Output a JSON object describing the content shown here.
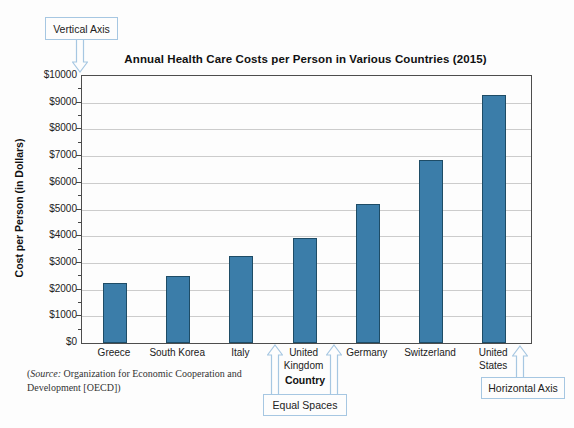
{
  "callouts": {
    "vertical_axis": "Vertical Axis",
    "horizontal_axis": "Horizontal Axis",
    "equal_spaces": "Equal Spaces"
  },
  "chart_data": {
    "type": "bar",
    "title": "Annual Health Care Costs per Person in Various Countries (2015)",
    "xlabel": "Country",
    "ylabel": "Cost per Person (in Dollars)",
    "categories": [
      "Greece",
      "South Korea",
      "Italy",
      "United Kingdom",
      "Germany",
      "Switzerland",
      "United States"
    ],
    "category_lines": [
      [
        "Greece"
      ],
      [
        "South Korea"
      ],
      [
        "Italy"
      ],
      [
        "United",
        "Kingdom"
      ],
      [
        "Germany"
      ],
      [
        "Switzerland"
      ],
      [
        "United",
        "States"
      ]
    ],
    "values": [
      2250,
      2500,
      3250,
      3950,
      5200,
      6850,
      9300
    ],
    "ylim": [
      0,
      10000
    ],
    "ytick_step": 1000,
    "ytick_minor_step": 500,
    "ytick_prefix": "$",
    "grid": true,
    "legend_position": "none",
    "bar_color": "#3b7da9",
    "bar_edge_color": "#1e4c66",
    "grid_color": "#cccccc",
    "callout_border_color": "#a6c7e2"
  },
  "source": {
    "prefix": "(",
    "label": "Source:",
    "line1_rest": " Organization for Economic Cooperation and",
    "line2": "Development [OECD])"
  }
}
